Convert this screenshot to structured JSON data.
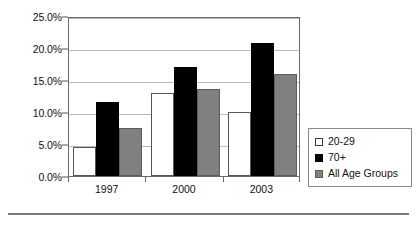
{
  "chart_data": {
    "type": "bar",
    "title": "",
    "subtitle": "",
    "xlabel": "",
    "ylabel": "",
    "categories": [
      "1997",
      "2000",
      "2003"
    ],
    "series": [
      {
        "name": "20-29",
        "values": [
          4.5,
          13.0,
          10.0
        ],
        "color": "#ffffff"
      },
      {
        "name": "70+",
        "values": [
          11.5,
          17.0,
          20.8
        ],
        "color": "#000000"
      },
      {
        "name": "All Age Groups",
        "values": [
          7.5,
          13.6,
          15.9
        ],
        "color": "#808080"
      }
    ],
    "ylim": [
      0,
      25
    ],
    "ytick_values": [
      0,
      5,
      10,
      15,
      20,
      25
    ],
    "ytick_labels": [
      "0.0%",
      "5.0%",
      "10.0%",
      "15.0%",
      "20.0%",
      "25.0%"
    ],
    "grid": true,
    "legend_position": "right",
    "value_suffix": "%"
  },
  "legend": {
    "entries": [
      {
        "label": "20-29"
      },
      {
        "label": "70+"
      },
      {
        "label": "All Age Groups"
      }
    ]
  },
  "colors": {
    "series_20_29": "#ffffff",
    "series_70_plus": "#000000",
    "series_all_ages": "#808080",
    "gridline": "#b9b9b9",
    "axis": "#6a6a6a",
    "text": "#111111",
    "rule": "#7a7a7a"
  }
}
